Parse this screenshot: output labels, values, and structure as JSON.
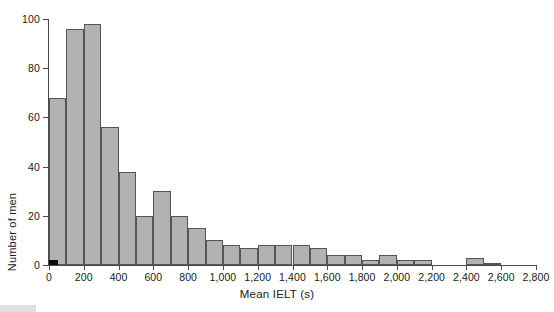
{
  "chart_data": {
    "type": "bar",
    "title": "",
    "xlabel": "Mean IELT (s)",
    "ylabel": "Number of men",
    "xlim": [
      0,
      2800
    ],
    "ylim": [
      0,
      100
    ],
    "grid": false,
    "legend": null,
    "bin_width": 100,
    "xticks": [
      "0",
      "200",
      "400",
      "600",
      "800",
      "1,000",
      "1,200",
      "1,400",
      "1,600",
      "1,800",
      "2,000",
      "2,200",
      "2,400",
      "2,600",
      "2,800"
    ],
    "xtick_values": [
      0,
      200,
      400,
      600,
      800,
      1000,
      1200,
      1400,
      1600,
      1800,
      2000,
      2200,
      2400,
      2600,
      2800
    ],
    "yticks": [
      "0",
      "20",
      "40",
      "60",
      "80",
      "100"
    ],
    "ytick_values": [
      0,
      20,
      40,
      60,
      80,
      100
    ],
    "categories": [
      "0-100",
      "100-200",
      "200-300",
      "300-400",
      "400-500",
      "500-600",
      "600-700",
      "700-800",
      "800-900",
      "900-1,000",
      "1,000-1,100",
      "1,100-1,200",
      "1,200-1,300",
      "1,300-1,400",
      "1,400-1,500",
      "1,500-1,600",
      "1,600-1,700",
      "1,700-1,800",
      "1,800-1,900",
      "1,900-2,000",
      "2,000-2,100",
      "2,100-2,200",
      "2,200-2,300",
      "2,300-2,400",
      "2,400-2,500",
      "2,500-2,600",
      "2,600-2,700",
      "2,700-2,800"
    ],
    "bin_starts": [
      0,
      100,
      200,
      300,
      400,
      500,
      600,
      700,
      800,
      900,
      1000,
      1100,
      1200,
      1300,
      1400,
      1500,
      1600,
      1700,
      1800,
      1900,
      2000,
      2100,
      2200,
      2300,
      2400,
      2500,
      2600,
      2700
    ],
    "values": [
      68,
      96,
      98,
      56,
      38,
      20,
      30,
      20,
      15,
      10,
      8,
      7,
      8,
      8,
      8,
      7,
      4,
      4,
      2,
      4,
      2,
      2,
      0,
      0,
      3,
      1,
      0,
      0
    ],
    "highlight_bar": {
      "index": 0,
      "label": "0-50",
      "value": 2,
      "color": "#0d0d0d",
      "width": 50
    },
    "bar_color": "#b2b2b2",
    "bar_edge_color": "#555555"
  },
  "axes": {
    "y_axis_title": "Number of men",
    "x_axis_title": "Mean IELT (s)"
  }
}
